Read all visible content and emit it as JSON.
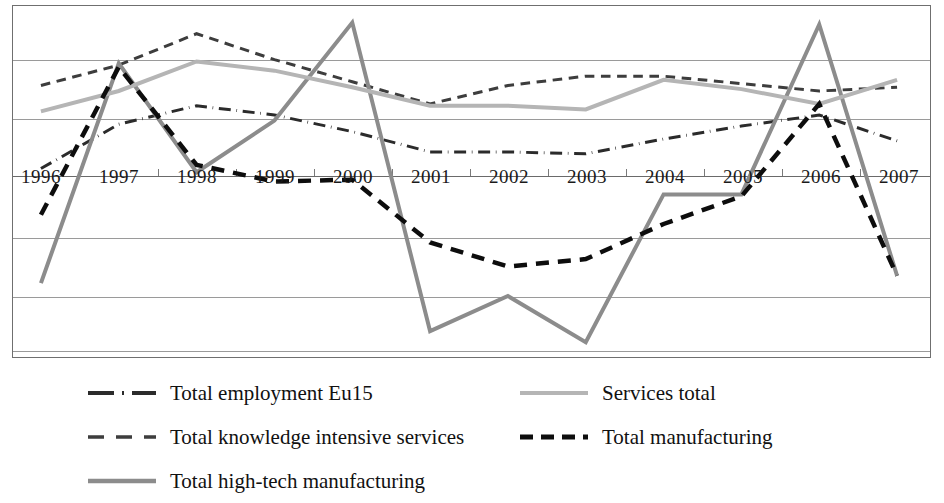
{
  "chart_data": {
    "type": "line",
    "title": "",
    "subtitle": "",
    "xlabel": "",
    "ylabel": "",
    "grid": true,
    "legend_position": "bottom",
    "gridlines_count": 7,
    "categories": [
      "1996",
      "1997",
      "1998",
      "1999",
      "2000",
      "2001",
      "2002",
      "2003",
      "2004",
      "2005",
      "2006",
      "2007"
    ],
    "x": [
      1996,
      1997,
      1998,
      1999,
      2000,
      2001,
      2002,
      2003,
      2004,
      2005,
      2006,
      2007
    ],
    "ylim": [
      -3.0,
      6.5
    ],
    "axis_value_at_category_line": 0,
    "series": [
      {
        "name": "Total employment Eu15",
        "style": "dash-dot",
        "color": "#2b2b2b",
        "width": 3,
        "values": [
          2.1,
          3.3,
          3.8,
          3.55,
          3.1,
          2.55,
          2.55,
          2.5,
          2.9,
          3.25,
          3.55,
          2.85
        ]
      },
      {
        "name": "Total knowledge intensive services",
        "style": "dashed",
        "color": "#3d3d3d",
        "width": 3,
        "values": [
          4.35,
          4.9,
          5.75,
          5.05,
          4.45,
          3.85,
          4.35,
          4.6,
          4.6,
          4.4,
          4.2,
          4.3
        ]
      },
      {
        "name": "Total high-tech manufacturing",
        "style": "solid",
        "color": "#8c8c8c",
        "width": 4,
        "values": [
          -1.0,
          4.95,
          2.0,
          3.4,
          6.05,
          -2.3,
          -1.35,
          -2.6,
          1.4,
          1.4,
          6.0,
          -0.8
        ]
      },
      {
        "name": "Services total",
        "style": "solid",
        "color": "#b5b5b5",
        "width": 4,
        "values": [
          3.65,
          4.2,
          5.0,
          4.75,
          4.3,
          3.8,
          3.8,
          3.7,
          4.5,
          4.25,
          3.85,
          4.5
        ]
      },
      {
        "name": "Total manufacturing",
        "style": "dashed-bold",
        "color": "#0d0d0d",
        "width": 4.5,
        "values": [
          0.85,
          4.85,
          2.2,
          1.75,
          1.8,
          0.1,
          -0.55,
          -0.35,
          0.6,
          1.35,
          3.85,
          -0.8
        ]
      }
    ]
  },
  "axis": {
    "tick_labels": [
      "1996",
      "1997",
      "1998",
      "1999",
      "2000",
      "2001",
      "2002",
      "2003",
      "2004",
      "2005",
      "2006",
      "2007"
    ]
  },
  "legend": {
    "entries": [
      {
        "label": "Total employment Eu15",
        "style": "dash-dot",
        "color": "#2b2b2b"
      },
      {
        "label": "Total knowledge intensive services",
        "style": "dashed",
        "color": "#3d3d3d"
      },
      {
        "label": "Total high-tech manufacturing",
        "style": "solid",
        "color": "#8c8c8c"
      },
      {
        "label": "Services total",
        "style": "solid-light",
        "color": "#b5b5b5"
      },
      {
        "label": "Total manufacturing",
        "style": "dashed-bold",
        "color": "#0d0d0d"
      }
    ]
  },
  "colors": {
    "frame": "#6f6f6f",
    "gridline": "#9a9a9a",
    "background": "#ffffff",
    "text": "#111111"
  }
}
